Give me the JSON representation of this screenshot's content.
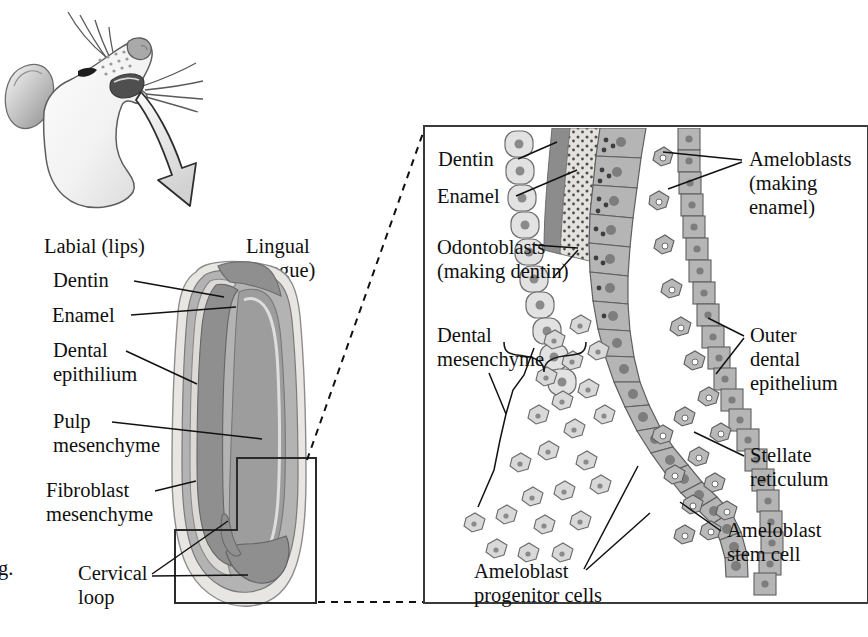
{
  "figure": {
    "caption_fragment": "g.",
    "orientation_labels": [
      {
        "id": "labial",
        "text_line1": "Labial (lips)"
      },
      {
        "id": "lingual",
        "text_line1": "Lingual",
        "text_line2": "(tongue)"
      }
    ]
  },
  "left_panel": {
    "name": "whole-incisor-cross-section",
    "labels": [
      {
        "id": "dentin",
        "line1": "Dentin",
        "line2": ""
      },
      {
        "id": "enamel",
        "line1": "Enamel",
        "line2": ""
      },
      {
        "id": "dental-epithilium",
        "line1": "Dental",
        "line2": "epithilium"
      },
      {
        "id": "pulp-mesenchyme",
        "line1": "Pulp",
        "line2": "mesenchyme"
      },
      {
        "id": "fibroblast-mesenchyme",
        "line1": "Fibroblast",
        "line2": "mesenchyme"
      },
      {
        "id": "cervical-loop",
        "line1": "Cervical",
        "line2": "loop"
      }
    ]
  },
  "right_panel": {
    "name": "cervical-loop-detail",
    "labels": [
      {
        "id": "dentin",
        "line1": "Dentin",
        "line2": "",
        "line3": ""
      },
      {
        "id": "enamel",
        "line1": "Enamel",
        "line2": "",
        "line3": ""
      },
      {
        "id": "odontoblasts",
        "line1": "Odontoblasts",
        "line2": "(making dentin)",
        "line3": ""
      },
      {
        "id": "ameloblasts",
        "line1": "Ameloblasts",
        "line2": "(making",
        "line3": "enamel)"
      },
      {
        "id": "dental-mesenchyme",
        "line1": "Dental",
        "line2": "mesenchyme",
        "line3": ""
      },
      {
        "id": "outer-dental-epithelium",
        "line1": "Outer",
        "line2": "dental",
        "line3": "epithelium"
      },
      {
        "id": "stellate-reticulum",
        "line1": "Stellate",
        "line2": "reticulum",
        "line3": ""
      },
      {
        "id": "ameloblast-stem-cell",
        "line1": "Ameloblast",
        "line2": "stem cell",
        "line3": ""
      },
      {
        "id": "ameloblast-progenitor-cells",
        "line1": "Ameloblast",
        "line2": "progenitor cells",
        "line3": ""
      }
    ]
  },
  "colors": {
    "ink": "#100f0f",
    "panel_border": "#3a3a3a",
    "enamel_light": "#e9e7e3",
    "dentin_mid": "#9b9b9b",
    "epithelium_gray": "#a9a9a9",
    "pulp_gray": "#8e8e8e",
    "cell_fill": "#bcbcbc",
    "cell_fill_light": "#e2e2e2",
    "nucleus": "#7a7a7a",
    "background": "#ffffff"
  }
}
